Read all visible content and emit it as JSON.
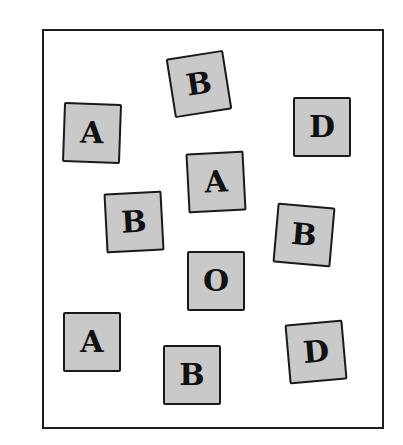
{
  "figure": {
    "colors": {
      "frame_border": "#1e1e1e",
      "tile_fill": "#c9c9c9",
      "tile_border": "#1a1a1a",
      "letter": "#111111"
    },
    "tiles": [
      {
        "letter": "B",
        "cx": 199,
        "cy": 84,
        "rotate": -9
      },
      {
        "letter": "A",
        "cx": 92,
        "cy": 133,
        "rotate": 2
      },
      {
        "letter": "D",
        "cx": 322,
        "cy": 127,
        "rotate": 0
      },
      {
        "letter": "A",
        "cx": 216,
        "cy": 182,
        "rotate": -3
      },
      {
        "letter": "B",
        "cx": 134,
        "cy": 222,
        "rotate": -3
      },
      {
        "letter": "B",
        "cx": 304,
        "cy": 235,
        "rotate": 5
      },
      {
        "letter": "O",
        "cx": 216,
        "cy": 281,
        "rotate": 0
      },
      {
        "letter": "A",
        "cx": 92,
        "cy": 342,
        "rotate": 0
      },
      {
        "letter": "B",
        "cx": 192,
        "cy": 375,
        "rotate": 0
      },
      {
        "letter": "D",
        "cx": 316,
        "cy": 352,
        "rotate": -5
      }
    ]
  }
}
